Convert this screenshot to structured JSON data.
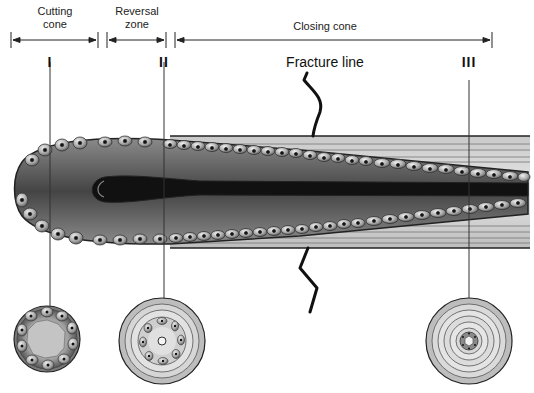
{
  "diagram": {
    "segments": [
      {
        "id": "cutting",
        "label": "Cutting cone",
        "line1": "Cutting",
        "line2": "cone"
      },
      {
        "id": "reversal",
        "label": "Reversal zone",
        "line1": "Reversal",
        "line2": "zone"
      },
      {
        "id": "closing",
        "label": "Closing cone"
      }
    ],
    "fracture_label": "Fracture line",
    "sections": [
      {
        "id": "I",
        "label": "I"
      },
      {
        "id": "II",
        "label": "II"
      },
      {
        "id": "III",
        "label": "III"
      }
    ],
    "colors": {
      "line": "#222222",
      "tissue_dark": "#555555",
      "tissue_light": "#bdbdbd",
      "canal": "#111111",
      "bone_light": "#d8d8d8",
      "bone_mid": "#a8a8a8"
    }
  }
}
